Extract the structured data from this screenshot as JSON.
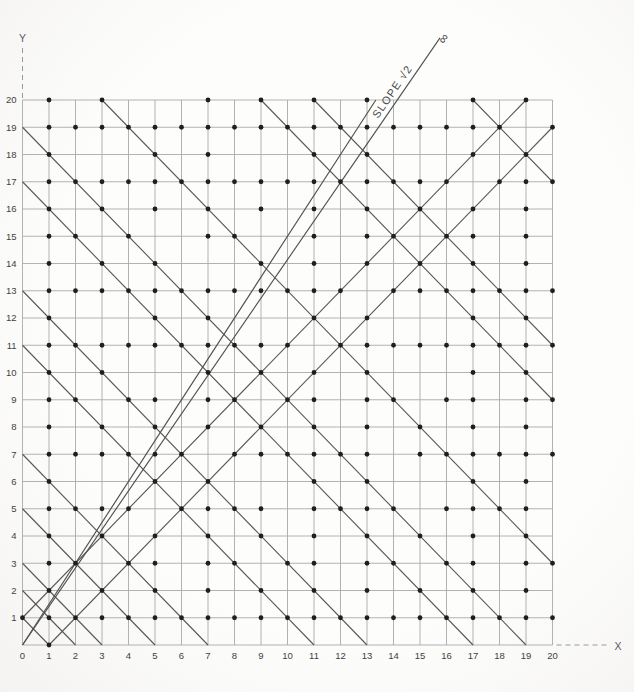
{
  "page": {
    "background": "#fcfcfb"
  },
  "axes": {
    "x_label": "X",
    "y_label": "Y",
    "x_ticks": [
      0,
      1,
      2,
      3,
      4,
      5,
      6,
      7,
      8,
      9,
      10,
      11,
      12,
      13,
      14,
      15,
      16,
      17,
      18,
      19,
      20
    ],
    "y_ticks": [
      1,
      2,
      3,
      4,
      5,
      6,
      7,
      8,
      9,
      10,
      11,
      12,
      13,
      14,
      15,
      16,
      17,
      18,
      19,
      20
    ],
    "x_range": [
      0,
      20
    ],
    "y_range": [
      0,
      20
    ]
  },
  "annotations": {
    "slope_label": "SLOPE √2",
    "infinity_symbol": "∞"
  },
  "colors": {
    "grid": "#a9a9a9",
    "diagonal": "#575757",
    "ray": "#4f4f4f",
    "dot": "#1f1f1f",
    "tick_text": "#3f3f3f",
    "axis_dashed": "#999999",
    "label_text": "#4a4a4a"
  },
  "chart_data": {
    "type": "scatter",
    "xlabel": "X",
    "ylabel": "Y",
    "xlim": [
      0,
      20
    ],
    "ylim": [
      0,
      20
    ],
    "grid": "on",
    "lattice": {
      "x_range": [
        0,
        20
      ],
      "y_range": [
        0,
        20
      ],
      "visible_points_rule": "dot at every lattice point (x,y), 0<=x,y<=20, with gcd(x,y)=1"
    },
    "anti_diagonals_x_plus_y": [
      1,
      2,
      3,
      5,
      7,
      11,
      13,
      17,
      19,
      23,
      29,
      31,
      37
    ],
    "ascending_diagonals_y_minus_x": [
      1,
      -1
    ],
    "rays_from_origin": [
      {
        "slope_value": 1.4142135,
        "label": "SLOPE √2",
        "extends_past_grid": true,
        "end_marker": "∞"
      },
      {
        "slope_value": 1.5,
        "label": "",
        "extends_past_grid": false
      }
    ]
  }
}
